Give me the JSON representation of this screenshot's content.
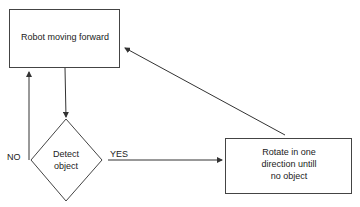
{
  "diagram": {
    "type": "flowchart",
    "nodes": [
      {
        "id": "n1",
        "shape": "rectangle",
        "label": "Robot moving forward"
      },
      {
        "id": "n2",
        "shape": "diamond",
        "label_line1": "Detect",
        "label_line2": "object"
      },
      {
        "id": "n3",
        "shape": "rectangle",
        "label_line1": "Rotate in one",
        "label_line2": "direction untill",
        "label_line3": "no object"
      }
    ],
    "edges": [
      {
        "from": "n1",
        "to": "n2",
        "label": ""
      },
      {
        "from": "n2",
        "to": "n1",
        "label": "NO"
      },
      {
        "from": "n2",
        "to": "n3",
        "label": "YES"
      },
      {
        "from": "n3",
        "to": "n1",
        "label": ""
      }
    ],
    "labels": {
      "no": "NO",
      "yes": "YES"
    }
  }
}
